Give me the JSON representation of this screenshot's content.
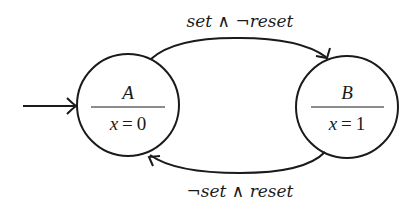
{
  "diagram": {
    "type": "state-machine",
    "states": [
      {
        "id": "A",
        "name": "A",
        "output_var": "x",
        "output_eq": "=",
        "output_val": "0",
        "initial": true
      },
      {
        "id": "B",
        "name": "B",
        "output_var": "x",
        "output_eq": "=",
        "output_val": "1",
        "initial": false
      }
    ],
    "transitions": [
      {
        "from": "A",
        "to": "B",
        "label": "set ∧ ¬reset"
      },
      {
        "from": "B",
        "to": "A",
        "label": "¬set ∧ reset"
      }
    ],
    "colors": {
      "stroke": "#1a1a1a",
      "background": "#ffffff"
    }
  }
}
